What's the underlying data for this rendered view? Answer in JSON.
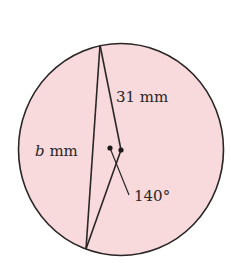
{
  "diagram": {
    "type": "circle-geometry",
    "fill_color": "#f8d9dc",
    "stroke_color": "#2a2626",
    "labels": {
      "side_31": "31 mm",
      "side_b_var": "b",
      "side_b_unit": " mm",
      "angle": "140°"
    }
  }
}
